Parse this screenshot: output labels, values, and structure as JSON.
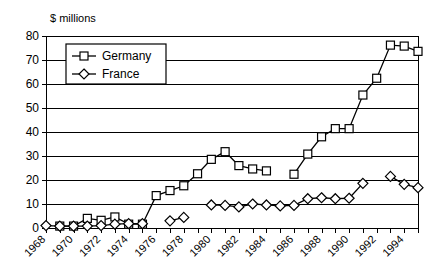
{
  "chart_data": {
    "type": "line",
    "title": "",
    "subtitle": "",
    "xlabel": "",
    "ylabel": "$ millions",
    "ylabel_position": "top-left",
    "ylim": [
      0,
      80
    ],
    "ytick_step": 10,
    "yticks": [
      "0",
      "10",
      "20",
      "30",
      "40",
      "50",
      "60",
      "70",
      "80"
    ],
    "xlim": [
      1968,
      1995
    ],
    "x_tick_step_minor": 1,
    "x_tick_step_labeled": 2,
    "xticks": [
      "1968",
      "1970",
      "1972",
      "1974",
      "1976",
      "1978",
      "1980",
      "1982",
      "1984",
      "1986",
      "1988",
      "1990",
      "1992",
      "1994"
    ],
    "x_all_years": [
      1968,
      1969,
      1970,
      1971,
      1972,
      1973,
      1974,
      1975,
      1976,
      1977,
      1978,
      1979,
      1980,
      1981,
      1982,
      1983,
      1984,
      1985,
      1986,
      1987,
      1988,
      1989,
      1990,
      1991,
      1992,
      1993,
      1994,
      1995
    ],
    "grid": "horizontal",
    "legend_position": "top-left-inside",
    "legend_entries": [
      "Germany",
      "France"
    ],
    "series": [
      {
        "name": "Germany",
        "marker": "square",
        "color": "#000000",
        "points": [
          {
            "x": 1969,
            "y": 0.8
          },
          {
            "x": 1970,
            "y": 0.8
          },
          {
            "x": 1971,
            "y": 4.0
          },
          {
            "x": 1972,
            "y": 3.2
          },
          {
            "x": 1973,
            "y": 4.6
          },
          {
            "x": 1974,
            "y": 1.6
          },
          {
            "x": 1975,
            "y": 1.6
          },
          {
            "x": 1976,
            "y": 13.5
          },
          {
            "x": 1977,
            "y": 15.6
          },
          {
            "x": 1978,
            "y": 17.6
          },
          {
            "x": 1979,
            "y": 22.6
          },
          {
            "x": 1980,
            "y": 28.6
          },
          {
            "x": 1981,
            "y": 31.8
          },
          {
            "x": 1982,
            "y": 26.0
          },
          {
            "x": 1983,
            "y": 24.6
          },
          {
            "x": 1984,
            "y": 23.8
          },
          {
            "x": 1986,
            "y": 22.4
          },
          {
            "x": 1987,
            "y": 30.8
          },
          {
            "x": 1988,
            "y": 38.0
          },
          {
            "x": 1989,
            "y": 41.4
          },
          {
            "x": 1990,
            "y": 41.4
          },
          {
            "x": 1991,
            "y": 55.4
          },
          {
            "x": 1992,
            "y": 62.4
          },
          {
            "x": 1993,
            "y": 76.2
          },
          {
            "x": 1994,
            "y": 75.8
          },
          {
            "x": 1995,
            "y": 73.6
          }
        ]
      },
      {
        "name": "France",
        "marker": "diamond",
        "color": "#000000",
        "points": [
          {
            "x": 1968,
            "y": 1.0
          },
          {
            "x": 1969,
            "y": 0.8
          },
          {
            "x": 1970,
            "y": 0.8
          },
          {
            "x": 1971,
            "y": 0.8
          },
          {
            "x": 1972,
            "y": 1.0
          },
          {
            "x": 1973,
            "y": 1.6
          },
          {
            "x": 1974,
            "y": 1.8
          },
          {
            "x": 1975,
            "y": 1.8
          },
          {
            "x": 1977,
            "y": 3.0
          },
          {
            "x": 1978,
            "y": 4.4
          },
          {
            "x": 1980,
            "y": 9.6
          },
          {
            "x": 1981,
            "y": 9.4
          },
          {
            "x": 1982,
            "y": 8.8
          },
          {
            "x": 1983,
            "y": 10.0
          },
          {
            "x": 1984,
            "y": 9.6
          },
          {
            "x": 1985,
            "y": 9.2
          },
          {
            "x": 1986,
            "y": 9.4
          },
          {
            "x": 1987,
            "y": 12.2
          },
          {
            "x": 1988,
            "y": 12.6
          },
          {
            "x": 1989,
            "y": 12.2
          },
          {
            "x": 1990,
            "y": 12.4
          },
          {
            "x": 1991,
            "y": 18.6
          },
          {
            "x": 1993,
            "y": 21.5
          },
          {
            "x": 1994,
            "y": 18.2
          },
          {
            "x": 1995,
            "y": 16.8
          }
        ]
      }
    ]
  },
  "layout": {
    "plot_left": 46,
    "plot_right": 418,
    "plot_top": 36,
    "plot_bottom": 228,
    "legend": {
      "x": 66,
      "y": 44,
      "width": 100,
      "height": 40
    }
  }
}
